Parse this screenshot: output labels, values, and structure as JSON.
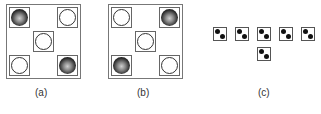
{
  "figures": [
    {
      "id": "a",
      "label": "(a)",
      "cells": [
        {
          "pos": "top-left",
          "ball": "black"
        },
        {
          "pos": "top-right",
          "ball": "white"
        },
        {
          "pos": "center",
          "ball": "white"
        },
        {
          "pos": "bottom-left",
          "ball": "white"
        },
        {
          "pos": "bottom-right",
          "ball": "black"
        }
      ]
    },
    {
      "id": "b",
      "label": "(b)",
      "cells": [
        {
          "pos": "top-left",
          "ball": "white"
        },
        {
          "pos": "top-right",
          "ball": "black"
        },
        {
          "pos": "center",
          "ball": "white"
        },
        {
          "pos": "bottom-left",
          "ball": "black"
        },
        {
          "pos": "bottom-right",
          "ball": "white"
        }
      ]
    },
    {
      "id": "c",
      "label": "(c)",
      "tiles": 6,
      "tile_pattern": "two dots: top-left and bottom-right"
    }
  ]
}
